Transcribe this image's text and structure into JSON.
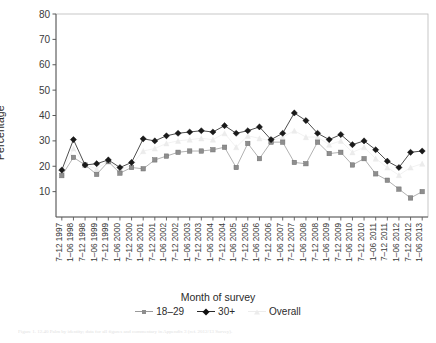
{
  "chart_data": {
    "type": "line",
    "title": "",
    "xlabel": "Month of survey",
    "ylabel": "Percentage",
    "ylim": [
      0,
      80
    ],
    "yticks": [
      10,
      20,
      30,
      40,
      50,
      60,
      70,
      80
    ],
    "grid": false,
    "legend_position": "bottom",
    "categories": [
      "7–12 1997",
      "1–06 1998",
      "7–12 1998",
      "1–06 1999",
      "7–12 1999",
      "1–06 2000",
      "7–12 2000",
      "1–06 2001",
      "7–12 2001",
      "1–06 2002",
      "7–12 2002",
      "1–06 2003",
      "7–12 2003",
      "1–06 2004",
      "7–12 2004",
      "1–06 2005",
      "7–12 2005",
      "1–06 2006",
      "7–12 2006",
      "1–06 2007",
      "7–12 2007",
      "1–06 2008",
      "7–12 2008",
      "1–06 2009",
      "7–12 2009",
      "1–06 2010",
      "7–12 2010",
      "1–06 2011",
      "7–12 2011",
      "1–06 2012",
      "7–12 2012",
      "1–06 2013"
    ],
    "series": [
      {
        "name": "18–29",
        "marker": "square",
        "color": "#8e8e8e",
        "values": [
          16.3,
          23.5,
          20.5,
          16.8,
          21.8,
          17.3,
          19.5,
          19.0,
          22.5,
          24.0,
          25.5,
          26.0,
          26.0,
          26.5,
          27.5,
          19.5,
          29.0,
          23.0,
          29.5,
          29.5,
          21.5,
          21.0,
          29.5,
          25.0,
          25.5,
          20.5,
          23.0,
          17.0,
          14.5,
          11.0,
          7.5,
          10.0
        ]
      },
      {
        "name": "30+",
        "marker": "diamond",
        "color": "#1a1a1a",
        "values": [
          18.5,
          30.5,
          20.5,
          21.0,
          22.5,
          19.5,
          21.5,
          30.8,
          30.0,
          32.0,
          33.0,
          33.5,
          34.0,
          33.5,
          36.0,
          33.0,
          34.0,
          35.5,
          30.5,
          33.0,
          41.0,
          38.0,
          33.0,
          30.5,
          32.5,
          28.5,
          30.0,
          26.5,
          22.0,
          19.5,
          25.5,
          26.0
        ]
      },
      {
        "name": "Overall",
        "marker": "triangle",
        "color": "#ececec",
        "values": [
          17.3,
          27.0,
          20.5,
          19.0,
          22.1,
          18.4,
          20.5,
          26.0,
          27.0,
          29.0,
          30.0,
          30.5,
          31.0,
          30.5,
          33.0,
          27.5,
          32.0,
          31.0,
          30.0,
          31.5,
          34.0,
          31.5,
          31.5,
          28.5,
          30.0,
          25.5,
          27.5,
          23.0,
          19.5,
          16.5,
          19.5,
          21.0
        ]
      }
    ]
  },
  "axis": {
    "ylabel": "Percentage",
    "xlabel": "Month of survey"
  },
  "legend": {
    "items": [
      {
        "label": "18–29"
      },
      {
        "label": "30+"
      },
      {
        "label": "Overall"
      }
    ]
  },
  "caption": {
    "text": "Figure 1.  12.40 Palm by identity; data for all figures and commentary in Appendix 3 (ref. 2012/13 Survey)."
  }
}
